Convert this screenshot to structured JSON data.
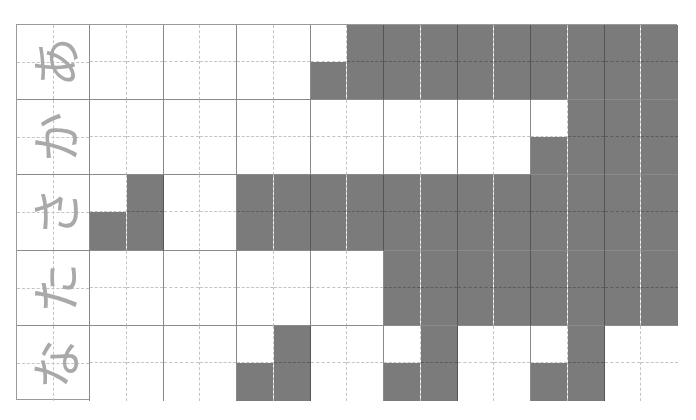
{
  "worksheet": {
    "columns_per_row": 16,
    "fill_color": "#7b7b7b",
    "line_color": "#8a8a8a",
    "label_color": "#a9a9a9",
    "rows": [
      {
        "label": "あ",
        "top": [
          7,
          8,
          9,
          10,
          11,
          12,
          13,
          14,
          15
        ],
        "bottom": [
          6,
          7,
          8,
          9,
          10,
          11,
          12,
          13,
          14,
          15
        ]
      },
      {
        "label": "か",
        "top": [
          13,
          14,
          15
        ],
        "bottom": [
          12,
          13,
          14,
          15
        ]
      },
      {
        "label": "さ",
        "top": [
          1,
          4,
          5,
          6,
          7,
          8,
          9,
          10,
          11,
          12,
          13,
          14,
          15
        ],
        "bottom": [
          0,
          1,
          4,
          5,
          6,
          7,
          8,
          9,
          10,
          11,
          12,
          13,
          14,
          15
        ]
      },
      {
        "label": "た",
        "top": [
          8,
          9,
          10,
          11,
          12,
          13,
          14,
          15
        ],
        "bottom": [
          8,
          9,
          10,
          11,
          12,
          13,
          14,
          15
        ]
      },
      {
        "label": "な",
        "top": [
          5,
          9,
          13
        ],
        "bottom": [
          4,
          5,
          8,
          9,
          12,
          13
        ]
      }
    ]
  }
}
